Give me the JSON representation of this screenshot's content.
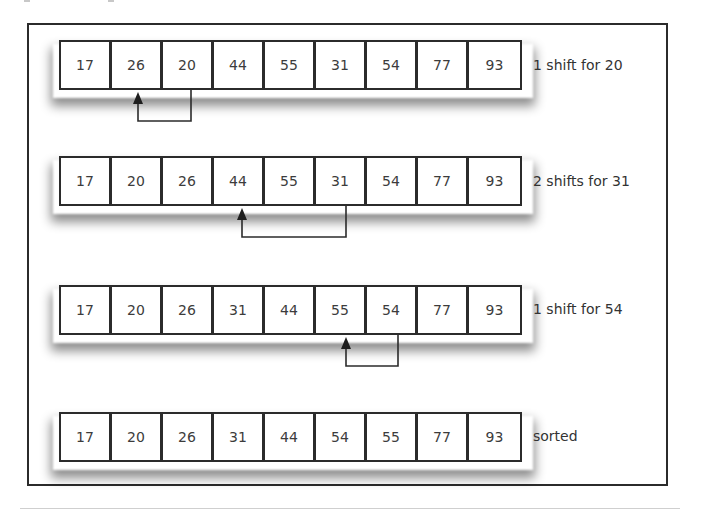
{
  "diagram": {
    "rows": [
      {
        "values": [
          "17",
          "26",
          "20",
          "44",
          "55",
          "31",
          "54",
          "77",
          "93"
        ],
        "label": "1 shift for 20",
        "arrow": {
          "from_index": 2,
          "to_index": 1
        }
      },
      {
        "values": [
          "17",
          "20",
          "26",
          "44",
          "55",
          "31",
          "54",
          "77",
          "93"
        ],
        "label": "2 shifts for 31",
        "arrow": {
          "from_index": 5,
          "to_index": 3
        }
      },
      {
        "values": [
          "17",
          "20",
          "26",
          "31",
          "44",
          "55",
          "54",
          "77",
          "93"
        ],
        "label": "1 shift for 54",
        "arrow": {
          "from_index": 6,
          "to_index": 5
        }
      },
      {
        "values": [
          "17",
          "20",
          "26",
          "31",
          "44",
          "54",
          "55",
          "77",
          "93"
        ],
        "label": "sorted",
        "arrow": null
      }
    ]
  },
  "colors": {
    "stroke": "#2b2b2b",
    "text": "#3c3c3c",
    "background": "#ffffff"
  }
}
